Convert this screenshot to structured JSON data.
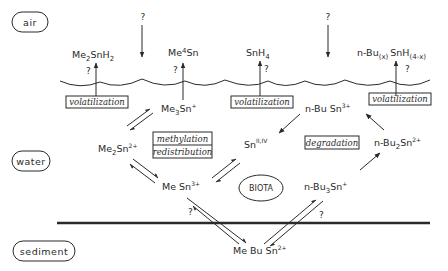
{
  "zones": {
    "air": "air",
    "water": "water",
    "sediment": "sediment"
  },
  "species": {
    "me2snh2": {
      "base": "Me",
      "sub1": "2",
      "mid": "SnH",
      "sub2": "2"
    },
    "me4sn": {
      "base": "Me",
      "sub1": "4",
      "mid": "Sn"
    },
    "snh4": {
      "base": "SnH",
      "sub1": "4"
    },
    "nbu_x_snh": {
      "base": "n-Bu",
      "sub1": "(x)",
      "mid": "SnH",
      "sub2": "(4-x)"
    },
    "me3sn": {
      "base": "Me",
      "sub1": "3",
      "mid": "Sn",
      "sup": "+"
    },
    "nbusn3": {
      "base": "n-Bu Sn",
      "sup": "3+"
    },
    "me2sn2": {
      "base": "Me",
      "sub1": "2",
      "mid": "Sn",
      "sup": "2+"
    },
    "sn_ii_iv": {
      "base": "Sn",
      "sup": "II,IV"
    },
    "nbu2sn2": {
      "base": "n-Bu",
      "sub1": "2",
      "mid": "Sn",
      "sup": "2+"
    },
    "mesn3": {
      "base": "Me Sn",
      "sup": "3+"
    },
    "nbu3sn": {
      "base": "n-Bu",
      "sub1": "3",
      "mid": "Sn",
      "sup": "+"
    },
    "mebusn2": {
      "base": "Me Bu Sn",
      "sup": "2+"
    }
  },
  "processes": {
    "volatilization": "volatilization",
    "methylation": "methylation",
    "redistribution": "redistribution",
    "degradation": "degradation"
  },
  "biota": "BIOTA",
  "unknown_mark": "?"
}
